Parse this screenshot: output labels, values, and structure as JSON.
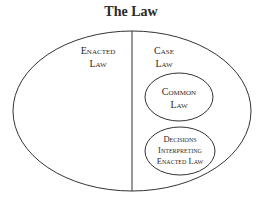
{
  "title": "The Law",
  "diagram": {
    "outer": {
      "label": "The Law"
    },
    "left_region": {
      "line1": "Enacted",
      "line2": "Law"
    },
    "right_region": {
      "line1": "Case",
      "line2": "Law"
    },
    "inner_circles": [
      {
        "line1": "Common",
        "line2": "Law"
      },
      {
        "line1": "Decisions",
        "line2": "Interpreting",
        "line3": "Enacted Law"
      }
    ]
  }
}
